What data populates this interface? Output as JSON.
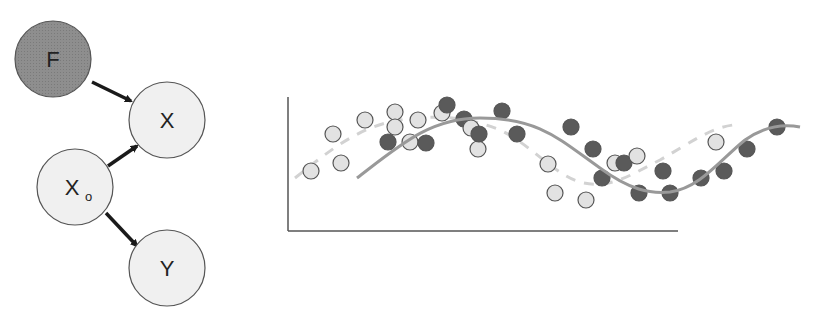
{
  "diagram": {
    "nodes": [
      {
        "id": "F",
        "label": "F",
        "sub": "",
        "cx": 53,
        "cy": 59,
        "r": 38,
        "fill": "#8e8e8e",
        "shaded": true
      },
      {
        "id": "X",
        "label": "X",
        "sub": "",
        "cx": 167,
        "cy": 120,
        "r": 38,
        "fill": "#f0f0f0",
        "shaded": false
      },
      {
        "id": "Xo",
        "label": "X",
        "sub": "o",
        "cx": 75,
        "cy": 187,
        "r": 38,
        "fill": "#f0f0f0",
        "shaded": false
      },
      {
        "id": "Y",
        "label": "Y",
        "sub": "",
        "cx": 167,
        "cy": 268,
        "r": 38,
        "fill": "#f0f0f0",
        "shaded": false
      }
    ],
    "edges": [
      {
        "from": "F",
        "to": "X",
        "x1": 92,
        "y1": 82,
        "x2": 131,
        "y2": 101
      },
      {
        "from": "Xo",
        "to": "X",
        "x1": 108,
        "y1": 166,
        "x2": 137,
        "y2": 146
      },
      {
        "from": "Xo",
        "to": "Y",
        "x1": 106,
        "y1": 213,
        "x2": 137,
        "y2": 246
      }
    ],
    "colors": {
      "stroke": "#555555",
      "arrow": "#1a1a1a",
      "shaded": "#8e8e8e",
      "light": "#f0f0f0"
    }
  },
  "chart_data": {
    "type": "scatter",
    "title": "",
    "xlabel": "",
    "ylabel": "",
    "grid": false,
    "legend": null,
    "axes": {
      "origin": [
        288,
        231
      ],
      "x_end": 678,
      "y_top": 97
    },
    "series": [
      {
        "name": "light points",
        "color": "#e2e2e2",
        "points": [
          [
            311,
            171
          ],
          [
            333,
            134
          ],
          [
            341,
            163
          ],
          [
            365,
            120
          ],
          [
            395,
            112
          ],
          [
            395,
            127
          ],
          [
            418,
            120
          ],
          [
            410,
            142
          ],
          [
            442,
            113
          ],
          [
            471,
            128
          ],
          [
            478,
            149
          ],
          [
            548,
            164
          ],
          [
            555,
            193
          ],
          [
            586,
            200
          ],
          [
            615,
            163
          ],
          [
            637,
            156
          ],
          [
            716,
            142
          ]
        ]
      },
      {
        "name": "dark points",
        "color": "#5a5a5a",
        "points": [
          [
            388,
            142
          ],
          [
            426,
            143
          ],
          [
            447,
            105
          ],
          [
            464,
            119
          ],
          [
            479,
            134
          ],
          [
            502,
            111
          ],
          [
            517,
            134
          ],
          [
            571,
            127
          ],
          [
            593,
            149
          ],
          [
            602,
            178
          ],
          [
            624,
            163
          ],
          [
            639,
            193
          ],
          [
            663,
            171
          ],
          [
            670,
            193
          ],
          [
            701,
            178
          ],
          [
            724,
            171
          ],
          [
            747,
            149
          ],
          [
            777,
            127
          ]
        ]
      },
      {
        "name": "solid curve",
        "style": "solid",
        "color": "#999999",
        "path": "M357,178 C400,145 430,118 480,118 C540,118 560,140 600,168 C630,190 650,194 670,192 C700,188 720,160 745,140 C765,126 785,124 800,127"
      },
      {
        "name": "dashed curve",
        "style": "dashed",
        "color": "#d2d2d2",
        "path": "M295,178 C330,150 360,126 400,120 C440,114 470,118 500,130 C530,144 555,175 580,182 C610,190 630,175 660,160 C690,143 710,128 733,125"
      }
    ]
  }
}
